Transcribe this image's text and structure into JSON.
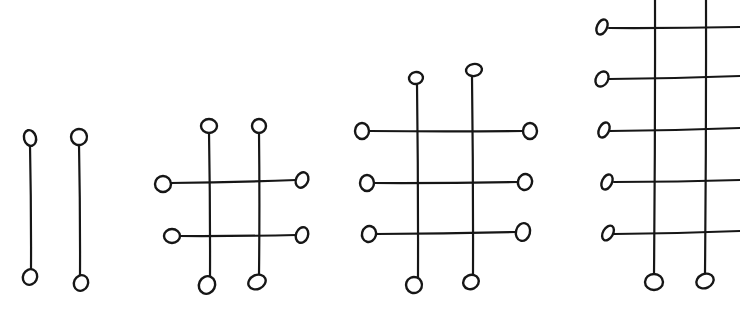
{
  "diagram": {
    "stroke_color": "#161616",
    "background": "#ffffff",
    "figures": [
      {
        "id": "figure-1",
        "vertical_count": 2,
        "horizontal_count": 0,
        "verticals": [
          {
            "x1": 30,
            "y1": 145,
            "x2": 31,
            "y2": 270,
            "top": [
              30,
              138,
              6,
              8,
              -15
            ],
            "bottom": [
              30,
              277,
              7,
              8,
              25
            ]
          },
          {
            "x1": 79,
            "y1": 144,
            "x2": 80,
            "y2": 276,
            "top": [
              79,
              137,
              8,
              8,
              20
            ],
            "bottom": [
              81,
              283,
              7,
              8,
              25
            ]
          }
        ],
        "horizontals": []
      },
      {
        "id": "figure-2",
        "vertical_count": 2,
        "horizontal_count": 2,
        "verticals": [
          {
            "x1": 209,
            "y1": 132,
            "x2": 210,
            "y2": 278,
            "top": [
              209,
              126,
              8,
              7,
              0
            ],
            "bottom": [
              207,
              285,
              8,
              9,
              25
            ]
          },
          {
            "x1": 259,
            "y1": 132,
            "x2": 259,
            "y2": 275,
            "top": [
              259,
              126,
              7,
              7,
              0
            ],
            "bottom": [
              257,
              282,
              9,
              7,
              -25
            ]
          }
        ],
        "horizontals": [
          {
            "x1": 170,
            "y1": 183,
            "x2": 296,
            "y2": 180,
            "left": [
              163,
              184,
              8,
              8,
              0
            ],
            "right": [
              302,
              180,
              6,
              8,
              25
            ]
          },
          {
            "x1": 180,
            "y1": 236,
            "x2": 296,
            "y2": 235,
            "left": [
              172,
              236,
              8,
              7,
              0
            ],
            "right": [
              302,
              235,
              6,
              8,
              20
            ]
          }
        ]
      },
      {
        "id": "figure-3",
        "vertical_count": 2,
        "horizontal_count": 3,
        "verticals": [
          {
            "x1": 417,
            "y1": 84,
            "x2": 418,
            "y2": 278,
            "top": [
              416,
              78,
              7,
              6,
              -10
            ],
            "bottom": [
              414,
              285,
              8,
              8,
              20
            ]
          },
          {
            "x1": 472,
            "y1": 77,
            "x2": 473,
            "y2": 275,
            "top": [
              474,
              70,
              8,
              6,
              -10
            ],
            "bottom": [
              471,
              282,
              8,
              7,
              -25
            ]
          }
        ],
        "horizontals": [
          {
            "x1": 370,
            "y1": 131,
            "x2": 523,
            "y2": 131,
            "left": [
              362,
              131,
              7,
              8,
              0
            ],
            "right": [
              530,
              131,
              7,
              8,
              0
            ]
          },
          {
            "x1": 374,
            "y1": 183,
            "x2": 518,
            "y2": 182,
            "left": [
              367,
              183,
              7,
              8,
              0
            ],
            "right": [
              525,
              182,
              7,
              8,
              15
            ]
          },
          {
            "x1": 376,
            "y1": 234,
            "x2": 516,
            "y2": 232,
            "left": [
              369,
              234,
              7,
              8,
              15
            ],
            "right": [
              523,
              232,
              7,
              9,
              15
            ]
          }
        ]
      },
      {
        "id": "figure-4",
        "vertical_count": 2,
        "horizontal_count": 5,
        "cropped": "top and right edges",
        "verticals": [
          {
            "x1": 655,
            "y1": 0,
            "x2": 654,
            "y2": 274,
            "top": null,
            "bottom": [
              654,
              282,
              9,
              8,
              0
            ]
          },
          {
            "x1": 706,
            "y1": 0,
            "x2": 705,
            "y2": 273,
            "top": null,
            "bottom": [
              705,
              281,
              9,
              7,
              -25
            ]
          }
        ],
        "horizontals": [
          {
            "x1": 609,
            "y1": 28,
            "x2": 740,
            "y2": 27,
            "left": [
              602,
              27,
              5,
              8,
              25
            ],
            "right": null
          },
          {
            "x1": 609,
            "y1": 79,
            "x2": 740,
            "y2": 76,
            "left": [
              602,
              79,
              6,
              8,
              30
            ],
            "right": null
          },
          {
            "x1": 610,
            "y1": 131,
            "x2": 740,
            "y2": 128,
            "left": [
              604,
              130,
              5,
              8,
              25
            ],
            "right": null
          },
          {
            "x1": 614,
            "y1": 182,
            "x2": 740,
            "y2": 180,
            "left": [
              607,
              182,
              5,
              8,
              25
            ],
            "right": null
          },
          {
            "x1": 614,
            "y1": 234,
            "x2": 740,
            "y2": 231,
            "left": [
              608,
              233,
              5,
              8,
              30
            ],
            "right": null
          }
        ]
      }
    ]
  }
}
